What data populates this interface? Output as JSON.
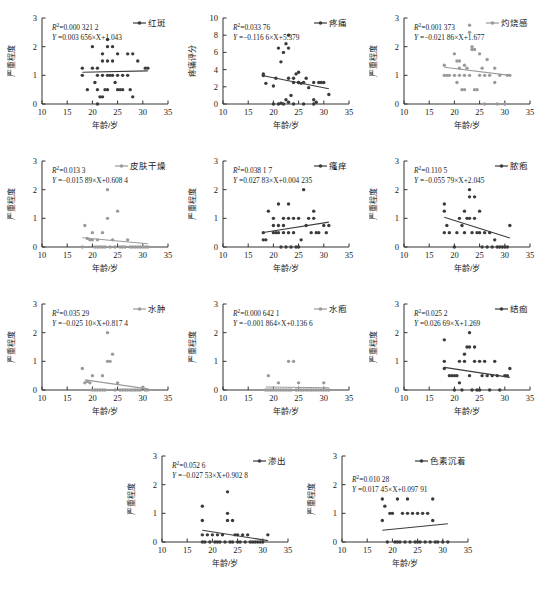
{
  "figure": {
    "xlabel": "年龄/岁",
    "ylabel_severity": "严重程度",
    "ylabel_pain": "疼痛评分",
    "x_ticks": [
      "10",
      "15",
      "20",
      "25",
      "30",
      "35"
    ],
    "y_ticks_3": [
      "0",
      "1",
      "2",
      "3"
    ],
    "y_ticks_10": [
      "0",
      "2",
      "4",
      "6",
      "8",
      "10"
    ],
    "xlim": [
      10,
      35
    ],
    "r2_prefix": "R",
    "r2_sup": "2"
  },
  "chart_data": {
    "type": "scatter",
    "title": "",
    "xlabel": "年龄/岁",
    "ylabel": "严重程度",
    "xlim": [
      10,
      35
    ],
    "grid": false,
    "legend_position": "top-right",
    "panels": [
      {
        "id": "p1",
        "legend": "红斑",
        "ylabel": "严重程度",
        "ylim": [
          0,
          3
        ],
        "yticks": [
          0,
          1,
          2,
          3
        ],
        "r2_label": "R²=0.000 321 2",
        "r2_value": 0.0003212,
        "eq_label": "Y =0.003 656×X+1.043",
        "slope": 0.003656,
        "intercept": 1.043,
        "color": "#3b3b3b",
        "fit_x": [
          18,
          31
        ],
        "x": [
          18,
          18,
          19,
          20,
          20,
          20.5,
          21,
          21,
          21,
          21,
          21.5,
          22,
          22,
          22,
          22,
          22.5,
          23,
          23,
          23,
          23,
          23,
          23.5,
          24,
          24,
          24,
          24.5,
          25,
          25,
          25,
          25.5,
          26,
          26,
          27,
          27,
          27.5,
          28,
          28,
          29,
          30.5,
          31
        ],
        "y": [
          1.25,
          1.0,
          0.5,
          2.0,
          1.25,
          0.75,
          1.25,
          1.0,
          0.5,
          0.0,
          0.25,
          1.75,
          1.5,
          1.0,
          0.25,
          0.5,
          2.25,
          2.0,
          1.5,
          1.0,
          0.5,
          1.0,
          2.0,
          1.5,
          1.0,
          0.75,
          1.75,
          1.0,
          0.5,
          0.5,
          1.0,
          0.5,
          1.75,
          1.0,
          0.5,
          1.75,
          0.25,
          1.5,
          1.25,
          1.25
        ]
      },
      {
        "id": "p2",
        "legend": "疼痛",
        "ylabel": "疼痛评分",
        "ylim": [
          0,
          10
        ],
        "yticks": [
          0,
          2,
          4,
          6,
          8,
          10
        ],
        "r2_label": "R²=0.033 76",
        "r2_value": 0.03376,
        "eq_label": "Y =−0.116 6×X+5.379",
        "slope": -0.1166,
        "intercept": 5.379,
        "color": "#3b3b3b",
        "fit_x": [
          18,
          31
        ],
        "x": [
          18,
          18,
          18.5,
          20,
          20,
          20.5,
          21,
          21,
          21.5,
          21.5,
          22,
          22,
          22.5,
          22.5,
          23,
          23,
          23,
          23,
          23.5,
          24,
          24,
          24,
          24.5,
          25,
          25,
          25,
          25.5,
          26,
          26,
          26.5,
          27,
          28,
          28,
          28,
          28.5,
          29,
          29.5,
          30,
          31
        ],
        "y": [
          3.5,
          3.3,
          2.4,
          2.1,
          0.0,
          3.0,
          6.5,
          0.0,
          4.9,
          0.1,
          6.0,
          0.0,
          7.0,
          0.5,
          8.0,
          6.5,
          3.0,
          0.2,
          1.0,
          3.0,
          2.5,
          0.0,
          3.5,
          3.7,
          2.5,
          2.5,
          2.4,
          2.5,
          0.0,
          3.0,
          1.9,
          2.5,
          0.5,
          0.0,
          0.2,
          2.5,
          2.5,
          2.5,
          1.1
        ]
      },
      {
        "id": "p3",
        "legend": "灼烧感",
        "ylabel": "严重程度",
        "ylim": [
          0,
          3
        ],
        "yticks": [
          0,
          1,
          2,
          3
        ],
        "r2_label": "R²=0.001 373",
        "r2_value": 0.001373,
        "eq_label": "Y =−0.021 86×X+1.677",
        "slope": -0.02186,
        "intercept": 1.677,
        "color": "#9a9a9a",
        "fit_x": [
          18,
          31
        ],
        "x": [
          18,
          18,
          18.5,
          19,
          20,
          20,
          20.5,
          20.5,
          21,
          21,
          21,
          21.5,
          22,
          22,
          22,
          22.5,
          23,
          23,
          23,
          23.5,
          23.5,
          24,
          24,
          24.5,
          25,
          25,
          25.5,
          26,
          26,
          26.5,
          27,
          28,
          28,
          28.5,
          29,
          30,
          30.5,
          31
        ],
        "y": [
          1.35,
          1.0,
          1.0,
          1.0,
          1.75,
          1.0,
          1.5,
          0.75,
          1.5,
          1.25,
          1.0,
          0.5,
          1.35,
          1.0,
          0.5,
          1.25,
          2.75,
          2.5,
          1.0,
          2.0,
          1.9,
          1.9,
          0.5,
          0.5,
          1.75,
          1.0,
          1.25,
          1.0,
          0.0,
          1.55,
          1.0,
          1.25,
          0.75,
          0.0,
          1.0,
          0.0,
          1.0,
          1.0
        ]
      },
      {
        "id": "p4",
        "legend": "皮肤干燥",
        "ylabel": "严重程度",
        "ylim": [
          0,
          3
        ],
        "yticks": [
          0,
          1,
          2,
          3
        ],
        "r2_label": "R²=0.013 3",
        "r2_value": 0.0133,
        "eq_label": "Y =−0.015 89×X+0.608 4",
        "slope": -0.01589,
        "intercept": 0.6084,
        "color": "#9a9a9a",
        "fit_x": [
          18,
          31
        ],
        "x": [
          18,
          18.5,
          19,
          19.5,
          20,
          20,
          20.5,
          21,
          21,
          21.5,
          22,
          22,
          22.5,
          23,
          23,
          23.5,
          24,
          24.5,
          25,
          25.5,
          26,
          26.5,
          27,
          27.5,
          28,
          28.5,
          29,
          29.5,
          30,
          30.5,
          31
        ],
        "y": [
          0.0,
          0.75,
          0.3,
          0.25,
          0.5,
          0.25,
          0.0,
          0.25,
          0.0,
          0.0,
          0.5,
          0.0,
          0.0,
          2.0,
          1.0,
          0.0,
          0.25,
          0.0,
          1.25,
          0.0,
          0.0,
          0.0,
          0.25,
          0.0,
          0.0,
          0.0,
          0.0,
          0.0,
          0.0,
          0.0,
          0.0
        ]
      },
      {
        "id": "p5",
        "legend": "瘙痒",
        "ylabel": "严重程度",
        "ylim": [
          0,
          3
        ],
        "yticks": [
          0,
          1,
          2,
          3
        ],
        "r2_label": "R²=0.038 1 7",
        "r2_value": 0.03817,
        "eq_label": "Y =0.027 83×X+0.004 235",
        "slope": 0.02783,
        "intercept": 0.004235,
        "color": "#3b3b3b",
        "fit_x": [
          18,
          31
        ],
        "x": [
          18,
          18,
          18.5,
          19,
          20,
          20,
          20,
          20.5,
          21,
          21,
          21,
          21.5,
          22,
          22,
          22,
          22.5,
          23,
          23,
          23,
          23.5,
          24,
          24,
          24.5,
          25,
          25,
          25.5,
          26,
          26.5,
          27,
          27.5,
          28,
          28,
          28.5,
          29,
          30,
          30.5,
          31
        ],
        "y": [
          0.5,
          0.25,
          0.25,
          1.25,
          1.0,
          0.75,
          0.5,
          0.5,
          1.5,
          0.75,
          0.5,
          0.0,
          1.0,
          0.75,
          0.5,
          0.0,
          1.5,
          1.0,
          0.5,
          0.0,
          1.0,
          0.5,
          0.0,
          1.0,
          0.0,
          0.25,
          2.0,
          0.75,
          1.0,
          0.5,
          1.25,
          1.0,
          0.5,
          0.5,
          0.75,
          0.5,
          0.75
        ]
      },
      {
        "id": "p6",
        "legend": "脓疱",
        "ylabel": "严重程度",
        "ylim": [
          0,
          3
        ],
        "yticks": [
          0,
          1,
          2,
          3
        ],
        "r2_label": "R²=0.110 5",
        "r2_value": 0.1105,
        "eq_label": "Y =−0.055 79×X+2.045",
        "slope": -0.05579,
        "intercept": 2.045,
        "color": "#3b3b3b",
        "fit_x": [
          18,
          31
        ],
        "x": [
          18,
          18,
          18,
          18.5,
          19,
          20,
          20.5,
          21,
          21.5,
          22,
          22,
          22.5,
          23,
          23,
          23,
          23.5,
          24,
          24,
          24.5,
          25,
          25,
          25.5,
          26,
          26.5,
          27,
          27.5,
          28,
          28.5,
          29,
          29.5,
          30,
          30.5,
          31
        ],
        "y": [
          1.5,
          1.25,
          0.5,
          0.75,
          0.5,
          0.0,
          0.5,
          1.0,
          0.75,
          1.25,
          0.5,
          1.0,
          2.0,
          1.75,
          1.0,
          0.5,
          1.75,
          1.0,
          0.5,
          1.25,
          0.5,
          0.0,
          0.5,
          0.0,
          0.5,
          0.0,
          0.25,
          0.0,
          0.0,
          0.0,
          0.0,
          0.0,
          0.75
        ]
      },
      {
        "id": "p7",
        "legend": "水肿",
        "ylabel": "严重程度",
        "ylim": [
          0,
          3
        ],
        "yticks": [
          0,
          1,
          2,
          3
        ],
        "r2_label": "R²=0.035 29",
        "r2_value": 0.03529,
        "eq_label": "Y =−0.025 10×X+0.817 4",
        "slope": -0.0251,
        "intercept": 0.8174,
        "color": "#9a9a9a",
        "fit_x": [
          18.5,
          31
        ],
        "x": [
          18,
          18.5,
          19,
          19.5,
          20,
          20,
          20.5,
          21,
          21.5,
          22,
          22,
          22.5,
          23,
          23,
          23.5,
          24,
          24.5,
          25,
          25.5,
          26,
          26.5,
          27,
          27.5,
          28,
          28.5,
          29,
          29.5,
          30,
          30.5,
          31
        ],
        "y": [
          0.75,
          0.25,
          0.3,
          0.25,
          0.5,
          0.0,
          0.0,
          0.0,
          0.0,
          0.5,
          0.0,
          0.0,
          2.0,
          1.0,
          1.0,
          1.25,
          0.0,
          0.25,
          0.0,
          0.0,
          0.0,
          0.0,
          0.0,
          0.0,
          0.0,
          0.0,
          0.0,
          0.1,
          0.0,
          0.0
        ]
      },
      {
        "id": "p8",
        "legend": "水疱",
        "ylabel": "严重程度",
        "ylim": [
          0,
          3
        ],
        "yticks": [
          0,
          1,
          2,
          3
        ],
        "r2_label": "R²=0.000 642 1",
        "r2_value": 0.0006421,
        "eq_label": "Y =−0.001 864×X+0.136 6",
        "slope": -0.001864,
        "intercept": 0.1366,
        "color": "#9a9a9a",
        "fit_x": [
          18.5,
          31
        ],
        "x": [
          18.5,
          19,
          19,
          19.5,
          20,
          20.5,
          21,
          21,
          21.5,
          22,
          22.5,
          23,
          23,
          23.5,
          24,
          24.5,
          25,
          25,
          25.5,
          26,
          26.5,
          27,
          27.5,
          28,
          28.5,
          29,
          29.5,
          30,
          30,
          30.5,
          31
        ],
        "y": [
          0.0,
          0.5,
          0.0,
          0.0,
          0.0,
          0.0,
          0.25,
          0.0,
          0.0,
          0.0,
          0.0,
          1.0,
          0.0,
          0.0,
          1.0,
          0.0,
          0.25,
          0.0,
          0.0,
          0.0,
          0.0,
          0.0,
          0.0,
          0.0,
          0.0,
          0.0,
          0.0,
          0.25,
          0.0,
          0.0,
          0.0
        ]
      },
      {
        "id": "p9",
        "legend": "结痂",
        "ylabel": "严重程度",
        "ylim": [
          0,
          3
        ],
        "yticks": [
          0,
          1,
          2,
          3
        ],
        "r2_label": "R²=0.025 2",
        "r2_value": 0.0252,
        "eq_label": "Y =0.026 69×X+1.269",
        "slope": -0.02669,
        "intercept": 1.269,
        "color": "#1a1a1a",
        "fit_x": [
          18,
          31
        ],
        "x": [
          18,
          18,
          18,
          19,
          19.5,
          20,
          20,
          20.5,
          21,
          21,
          21.5,
          22,
          22,
          22.5,
          23,
          23,
          23,
          23.5,
          24,
          24,
          24.5,
          25,
          25,
          25.5,
          26,
          26.5,
          27,
          27.5,
          28,
          28.5,
          29,
          30,
          30.5,
          31
        ],
        "y": [
          1.75,
          1.0,
          0.75,
          0.5,
          0.5,
          0.5,
          0.0,
          0.5,
          1.0,
          0.25,
          0.0,
          1.25,
          1.0,
          1.5,
          2.0,
          1.5,
          0.5,
          0.0,
          1.5,
          1.0,
          0.0,
          1.0,
          0.0,
          0.5,
          1.0,
          0.5,
          0.0,
          0.5,
          1.0,
          0.5,
          0.0,
          0.5,
          0.5,
          0.75
        ]
      },
      {
        "id": "p10",
        "legend": "渗出",
        "ylabel": "严重程度",
        "ylim": [
          0,
          3
        ],
        "yticks": [
          0,
          1,
          2,
          3
        ],
        "r2_label": "R²=0.052 6",
        "r2_value": 0.0526,
        "eq_label": "Y =−0.027 53×X+0.902 8",
        "slope": -0.02753,
        "intercept": 0.9028,
        "color": "#1a1a1a",
        "fit_x": [
          18,
          31
        ],
        "x": [
          18,
          18,
          18,
          18,
          18.5,
          19,
          19.5,
          20,
          20.5,
          21,
          21,
          21.5,
          22,
          22.5,
          23,
          23,
          23,
          23.5,
          24,
          24,
          24.5,
          25,
          25,
          25.5,
          26,
          26.5,
          27,
          27.5,
          28,
          28.5,
          29,
          29.5,
          30,
          31
        ],
        "y": [
          1.25,
          0.75,
          0.25,
          0.0,
          0.0,
          0.25,
          0.0,
          0.25,
          0.0,
          0.25,
          0.0,
          0.0,
          0.25,
          0.0,
          1.75,
          1.0,
          0.75,
          0.0,
          0.75,
          0.0,
          0.25,
          0.25,
          0.0,
          0.0,
          0.25,
          0.0,
          0.25,
          0.0,
          0.0,
          0.0,
          0.0,
          0.0,
          0.0,
          0.25
        ]
      },
      {
        "id": "p11",
        "legend": "色素沉着",
        "ylabel": "严重程度",
        "ylim": [
          0,
          3
        ],
        "yticks": [
          0,
          1,
          2,
          3
        ],
        "r2_label": "R²=0.010 28",
        "r2_value": 0.01028,
        "eq_label": "Y =0.017 45×X+0.097 91",
        "slope": 0.01745,
        "intercept": 0.09791,
        "color": "#1a1a1a",
        "fit_x": [
          18,
          31
        ],
        "x": [
          18,
          18,
          18.5,
          19,
          19.5,
          20,
          20.5,
          21,
          21,
          21.5,
          22,
          22.5,
          23,
          23,
          23.5,
          24,
          24.5,
          25,
          25,
          25.5,
          26,
          26.5,
          27,
          27.5,
          28,
          28,
          28.5,
          29,
          30,
          31
        ],
        "y": [
          1.5,
          0.75,
          1.25,
          0.0,
          1.0,
          1.0,
          0.0,
          1.5,
          0.0,
          0.0,
          1.0,
          0.0,
          1.5,
          1.0,
          0.0,
          1.0,
          0.0,
          1.0,
          0.0,
          0.0,
          1.0,
          0.0,
          1.0,
          0.0,
          1.5,
          0.75,
          0.0,
          0.0,
          0.0,
          0.0
        ]
      }
    ]
  }
}
